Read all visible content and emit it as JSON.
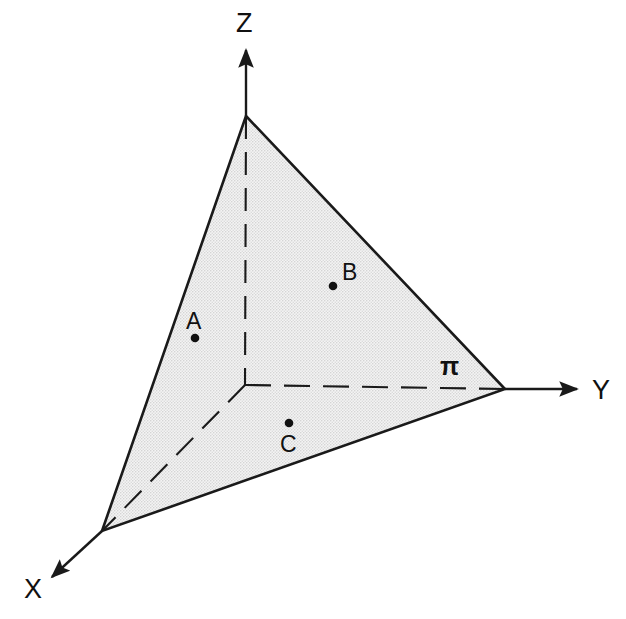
{
  "figure": {
    "background_color": "#ffffff",
    "line_color": "#1a1a1a",
    "plane_fill_color": "#e8e8e8",
    "plane_fill_label": "light gray halftone stipple"
  },
  "axes": [
    {
      "id": "x",
      "label": "X",
      "label_x": 24,
      "label_y": 598,
      "solid_from": {
        "x": 102,
        "y": 531
      },
      "solid_to": {
        "x": 46,
        "y": 582
      },
      "dashed_from": {
        "x": 245,
        "y": 385
      },
      "dashed_to": {
        "x": 102,
        "y": 531
      },
      "arrow": true,
      "direction": "down-left"
    },
    {
      "id": "y",
      "label": "Y",
      "label_x": 592,
      "label_y": 399,
      "solid_from": {
        "x": 505,
        "y": 389
      },
      "solid_to": {
        "x": 583,
        "y": 389
      },
      "dashed_from": {
        "x": 245,
        "y": 385
      },
      "dashed_to": {
        "x": 505,
        "y": 389
      },
      "arrow": true,
      "direction": "right"
    },
    {
      "id": "z",
      "label": "Z",
      "label_x": 236,
      "label_y": 32,
      "solid_from": {
        "x": 246,
        "y": 116
      },
      "solid_to": {
        "x": 246,
        "y": 44
      },
      "dashed_from": {
        "x": 246,
        "y": 116
      },
      "dashed_to": {
        "x": 245,
        "y": 385
      },
      "arrow": true,
      "direction": "up"
    }
  ],
  "origin": {
    "x": 245,
    "y": 385,
    "label": "O"
  },
  "plane": {
    "id": "pi",
    "label": "π",
    "label_x": 440,
    "label_y": 375,
    "vertices": [
      {
        "axis": "z",
        "x": 246,
        "y": 116
      },
      {
        "axis": "y",
        "x": 505,
        "y": 389
      },
      {
        "axis": "x",
        "x": 102,
        "y": 531
      }
    ]
  },
  "points": [
    {
      "name": "A",
      "dot_x": 195,
      "dot_y": 338,
      "label_x": 186,
      "label_y": 329,
      "label_position": "above"
    },
    {
      "name": "B",
      "dot_x": 333,
      "dot_y": 286,
      "label_x": 342,
      "label_y": 280,
      "label_position": "upper-right"
    },
    {
      "name": "C",
      "dot_x": 289,
      "dot_y": 423,
      "label_x": 280,
      "label_y": 452,
      "label_position": "below"
    }
  ]
}
